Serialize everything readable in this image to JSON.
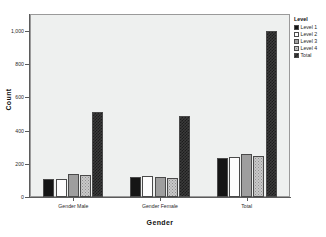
{
  "chart_data": {
    "type": "bar",
    "title": "",
    "xlabel": "Gender",
    "ylabel": "Count",
    "categories": [
      "Gender Male",
      "Gender Female",
      "Total"
    ],
    "series": [
      {
        "name": "Level 1",
        "values": [
          110,
          120,
          235
        ],
        "fill": "solid-black",
        "color": "#151515"
      },
      {
        "name": "Level 2",
        "values": [
          110,
          125,
          240
        ],
        "fill": "white",
        "color": "#fdfdfd"
      },
      {
        "name": "Level 3",
        "values": [
          140,
          118,
          258
        ],
        "fill": "solid-gray",
        "color": "#9e9e9e"
      },
      {
        "name": "Level 4",
        "values": [
          133,
          112,
          245
        ],
        "fill": "dotted-light",
        "color": "#c9c9c9"
      },
      {
        "name": "Total",
        "values": [
          510,
          488,
          1000
        ],
        "fill": "check-dark",
        "color": "#3b3b3b"
      }
    ],
    "ylim": [
      0,
      1050
    ],
    "yticks": [
      0,
      200,
      400,
      600,
      800,
      1000
    ],
    "ytick_labels": [
      "0",
      "200",
      "400",
      "600",
      "800",
      "1,000"
    ],
    "grid": false,
    "legend": {
      "title": "Level",
      "position": "right"
    },
    "plot_background": "#eef0ef",
    "page_background": "#ffffff"
  },
  "legend": {
    "title": "Level",
    "entries": [
      {
        "label": "Level 1"
      },
      {
        "label": "Level 2"
      },
      {
        "label": "Level 3"
      },
      {
        "label": "Level 4"
      },
      {
        "label": "Total"
      }
    ]
  },
  "axes": {
    "y_title": "Count",
    "x_title": "Gender"
  }
}
